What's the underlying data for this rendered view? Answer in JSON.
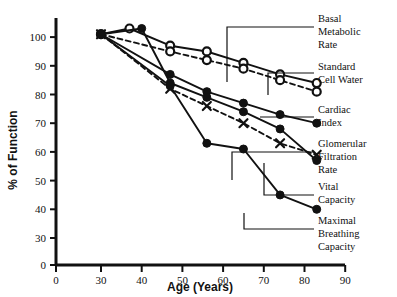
{
  "chart_data": {
    "type": "line",
    "title": "",
    "xlabel": "Age (Years)",
    "ylabel": "% of Function",
    "xlim": [
      30,
      90
    ],
    "ylim": [
      30,
      100
    ],
    "x_ticks": [
      0,
      30,
      40,
      50,
      60,
      70,
      80,
      90
    ],
    "y_ticks": [
      0,
      30,
      40,
      50,
      60,
      70,
      80,
      90,
      100
    ],
    "axis_break": true,
    "grid": false,
    "legend_position": "right",
    "series": [
      {
        "name": "Basal Metabolic Rate",
        "marker": "open-circle",
        "line": "solid",
        "x": [
          30,
          37,
          47,
          56,
          65,
          74,
          83
        ],
        "y": [
          101,
          103,
          97,
          95,
          91,
          87,
          84
        ]
      },
      {
        "name": "Standard Cell Water",
        "marker": "open-circle",
        "line": "dashed",
        "x": [
          30,
          47,
          56,
          65,
          74,
          83
        ],
        "y": [
          101,
          95,
          92,
          89,
          85,
          81
        ]
      },
      {
        "name": "Cardiac Index",
        "marker": "filled-circle",
        "line": "solid",
        "x": [
          30,
          47,
          56,
          65,
          74,
          83
        ],
        "y": [
          101,
          87,
          81,
          77,
          73,
          70
        ]
      },
      {
        "name": "Glomerular Filtration Rate",
        "marker": "cross",
        "line": "dashed",
        "x": [
          30,
          47,
          56,
          65,
          74,
          83
        ],
        "y": [
          101,
          82,
          76,
          70,
          63,
          59
        ]
      },
      {
        "name": "Vital Capacity",
        "marker": "filled-circle",
        "line": "solid",
        "x": [
          30,
          40,
          47,
          56,
          65,
          74,
          83
        ],
        "y": [
          101,
          103,
          84,
          79,
          74,
          68,
          57
        ]
      },
      {
        "name": "Maximal Breathing Capacity",
        "marker": "filled-circle",
        "line": "solid",
        "x": [
          30,
          47,
          56,
          65,
          74,
          83
        ],
        "y": [
          101,
          83,
          63,
          61,
          45,
          40
        ]
      }
    ]
  },
  "legend": {
    "items": [
      {
        "label_lines": [
          "Basal",
          "Metabolic",
          "Rate"
        ]
      },
      {
        "label_lines": [
          "Standard",
          "Cell Water"
        ]
      },
      {
        "label_lines": [
          "Cardiac",
          "Index"
        ]
      },
      {
        "label_lines": [
          "Glomerular",
          "Filtration",
          "Rate"
        ]
      },
      {
        "label_lines": [
          "Vital",
          "Capacity"
        ]
      },
      {
        "label_lines": [
          "Maximal",
          "Breathing",
          "Capacity"
        ]
      }
    ]
  },
  "axes": {
    "x_label": "Age (Years)",
    "y_label": "% of Function",
    "x_tick_labels": [
      "0",
      "30",
      "40",
      "50",
      "60",
      "70",
      "80",
      "90"
    ],
    "y_tick_labels": [
      "0",
      "30",
      "40",
      "50",
      "60",
      "70",
      "80",
      "90",
      "100"
    ]
  },
  "colors": {
    "ink": "#111111",
    "background": "#ffffff"
  }
}
